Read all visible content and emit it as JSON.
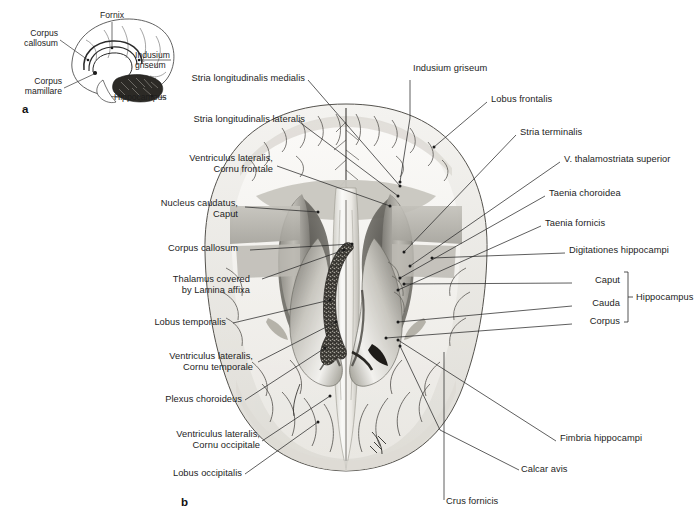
{
  "figure": {
    "panels": [
      {
        "id": "a",
        "letter": "a",
        "caption": "Median sagittal schematic of the fornix and hippocampus"
      },
      {
        "id": "b",
        "letter": "b",
        "caption": "Horizontal dissection of the cerebrum exposing the lateral ventricles"
      }
    ]
  },
  "inset": {
    "name": "sagittal-brain-schematic",
    "labels": [
      {
        "name": "corpus-callosum",
        "text": "Corpus\ncallosum"
      },
      {
        "name": "fornix",
        "text": "Fornix"
      },
      {
        "name": "indusium-griseum",
        "text": "Indusium\ngriseum"
      },
      {
        "name": "corpus-mamillare",
        "text": "Corpus\nmamillare"
      },
      {
        "name": "hippocampus",
        "text": "Hippocampus"
      }
    ]
  },
  "main": {
    "name": "horizontal-brain-dissection",
    "labels_left": [
      {
        "name": "stria-longitudinalis-medialis",
        "text": "Stria longitudinalis medialis"
      },
      {
        "name": "stria-longitudinalis-lateralis",
        "text": "Stria longitudinalis lateralis"
      },
      {
        "name": "ventriculus-lateralis-cornu-frontale",
        "text": "Ventriculus lateralis,\nCornu frontale"
      },
      {
        "name": "nucleus-caudatus-caput",
        "text": "Nucleus caudatus,\nCaput"
      },
      {
        "name": "corpus-callosum",
        "text": "Corpus callosum"
      },
      {
        "name": "thalamus-covered-by-lamina-affixa",
        "text": "Thalamus covered\nby Lamina affixa"
      },
      {
        "name": "lobus-temporalis",
        "text": "Lobus temporalis"
      },
      {
        "name": "ventriculus-lateralis-cornu-temporale",
        "text": "Ventriculus lateralis,\nCornu temporale"
      },
      {
        "name": "plexus-choroideus",
        "text": "Plexus choroideus"
      },
      {
        "name": "ventriculus-lateralis-cornu-occipitale",
        "text": "Ventriculus lateralis,\nCornu occipitale"
      },
      {
        "name": "lobus-occipitalis",
        "text": "Lobus occipitalis"
      }
    ],
    "labels_top": [
      {
        "name": "indusium-griseum",
        "text": "Indusium griseum"
      }
    ],
    "labels_right": [
      {
        "name": "lobus-frontalis",
        "text": "Lobus frontalis"
      },
      {
        "name": "stria-terminalis",
        "text": "Stria terminalis"
      },
      {
        "name": "v-thalamostriata-superior",
        "text": "V. thalamostriata superior"
      },
      {
        "name": "taenia-choroidea",
        "text": "Taenia choroidea"
      },
      {
        "name": "taenia-fornicis",
        "text": "Taenia fornicis"
      },
      {
        "name": "digitationes-hippocampi",
        "text": "Digitationes hippocampi"
      },
      {
        "name": "fimbria-hippocampi",
        "text": "Fimbria hippocampi"
      }
    ],
    "hippocampus_group": {
      "name": "hippocampus-bracket-group",
      "group_label": "Hippocampus",
      "parts": [
        {
          "name": "caput",
          "text": "Caput"
        },
        {
          "name": "cauda",
          "text": "Cauda"
        },
        {
          "name": "corpus",
          "text": "Corpus"
        }
      ]
    },
    "labels_bottom": [
      {
        "name": "calcar-avis",
        "text": "Calcar avis"
      },
      {
        "name": "crus-fornicis",
        "text": "Crus fornicis"
      }
    ]
  },
  "colors": {
    "page_background": "#ffffff",
    "text": "#1d1d1d",
    "leader_line": "#2a2a2a",
    "cortex_light": "#ebeae6",
    "white_matter": "#f6f5f2",
    "grey_matter": "#cfcdc6",
    "thalamus_grey": "#b4b2ab",
    "ventricle_dark": "#6e6c66",
    "plexus_dark": "#3a3833",
    "outline": "#5d5b56"
  }
}
